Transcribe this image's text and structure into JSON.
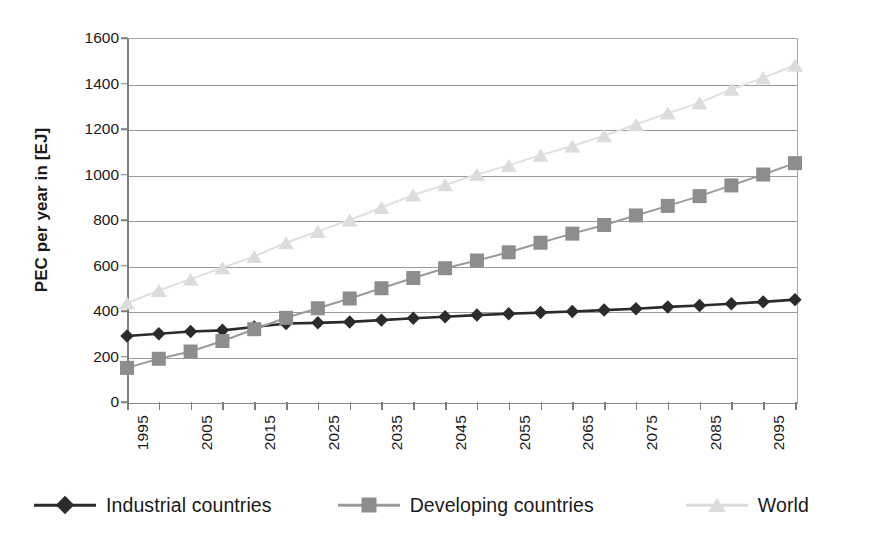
{
  "chart_data": {
    "type": "line",
    "title": "",
    "xlabel": "",
    "ylabel": "PEC per year in [EJ]",
    "ylim": [
      0,
      1600
    ],
    "xlim": [
      1995,
      2100
    ],
    "y_ticks": [
      0,
      200,
      400,
      600,
      800,
      1000,
      1200,
      1400,
      1600
    ],
    "x_tick_labels": [
      "1995",
      "2005",
      "2015",
      "2025",
      "2035",
      "2045",
      "2055",
      "2065",
      "2075",
      "2085",
      "2095"
    ],
    "x_tick_values": [
      1995,
      2005,
      2015,
      2025,
      2035,
      2045,
      2055,
      2065,
      2075,
      2085,
      2095
    ],
    "x": [
      1995,
      2000,
      2005,
      2010,
      2015,
      2020,
      2025,
      2030,
      2035,
      2040,
      2045,
      2050,
      2055,
      2060,
      2065,
      2070,
      2075,
      2080,
      2085,
      2090,
      2095,
      2100
    ],
    "grid": "horizontal",
    "legend_position": "bottom",
    "series": [
      {
        "name": "Industrial countries",
        "marker": "diamond",
        "color": "#2b2b2b",
        "values": [
          290,
          300,
          310,
          315,
          330,
          345,
          348,
          352,
          360,
          368,
          375,
          382,
          388,
          393,
          398,
          404,
          410,
          418,
          424,
          432,
          440,
          450
        ]
      },
      {
        "name": "Developing countries",
        "marker": "square",
        "color": "#8d8d8d",
        "values": [
          150,
          190,
          222,
          268,
          320,
          370,
          412,
          455,
          500,
          545,
          588,
          622,
          658,
          700,
          740,
          778,
          820,
          862,
          905,
          952,
          1000,
          1050
        ]
      },
      {
        "name": "World",
        "marker": "triangle",
        "color": "#dcdcdc",
        "values": [
          435,
          490,
          540,
          590,
          640,
          700,
          750,
          800,
          855,
          910,
          955,
          1000,
          1040,
          1085,
          1125,
          1170,
          1220,
          1270,
          1315,
          1375,
          1425,
          1480
        ]
      }
    ]
  },
  "legend": {
    "items": [
      {
        "label": "Industrial countries",
        "marker": "diamond-marker-icon"
      },
      {
        "label": "Developing countries",
        "marker": "square-marker-icon"
      },
      {
        "label": "World",
        "marker": "triangle-marker-icon"
      }
    ]
  },
  "axes": {
    "y_title": "PEC per year in [EJ]"
  },
  "colors": {
    "industrial": "#2b2b2b",
    "developing": "#8d8d8d",
    "world": "#dcdcdc",
    "gridline": "#9a9a9a",
    "axis": "#7d7d7d",
    "background": "#ffffff"
  }
}
